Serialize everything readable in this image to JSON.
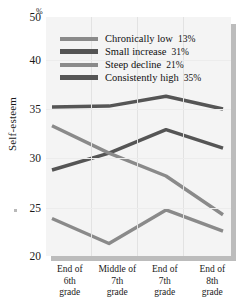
{
  "chart_data": {
    "type": "line",
    "title": "",
    "xlabel": "",
    "ylabel": "Self-esteem",
    "unit_symbol": "%",
    "categories": [
      "End of 6th grade",
      "Middle of 7th grade",
      "End of 7th grade",
      "End of 8th grade"
    ],
    "category_lines": [
      [
        "End of",
        "6th",
        "grade"
      ],
      [
        "Middle of",
        "7th",
        "grade"
      ],
      [
        "End of",
        "7th",
        "grade"
      ],
      [
        "End of",
        "8th",
        "grade"
      ]
    ],
    "yticks": [
      20,
      25,
      30,
      35,
      40,
      50
    ],
    "ytick_labels": [
      "20",
      "25",
      "30",
      "35",
      "40",
      "50"
    ],
    "ylim": [
      20,
      50
    ],
    "grid": true,
    "legend_position": "upper-center",
    "series": [
      {
        "name": "Chronically low",
        "share": "13%",
        "color": "#8a8a8a",
        "values": [
          23.9,
          21.3,
          24.8,
          22.6
        ]
      },
      {
        "name": "Small increase",
        "share": "31%",
        "color": "#555555",
        "values": [
          28.8,
          30.5,
          32.9,
          31.0
        ]
      },
      {
        "name": "Steep decline",
        "share": "21%",
        "color": "#8a8a8a",
        "values": [
          33.3,
          30.5,
          28.2,
          24.3
        ]
      },
      {
        "name": "Consistently high",
        "share": "35%",
        "color": "#555555",
        "values": [
          35.2,
          35.3,
          36.3,
          35.0
        ]
      }
    ]
  },
  "legend": {
    "items": [
      {
        "label": "Chronically low",
        "pct": "13%"
      },
      {
        "label": "Small increase",
        "pct": "31%"
      },
      {
        "label": "Steep decline",
        "pct": "21%"
      },
      {
        "label": "Consistently high",
        "pct": "35%"
      }
    ]
  },
  "axis": {
    "y_title": "Self-esteem",
    "percent_symbol": "%",
    "tick_50": "50",
    "tick_40": "40",
    "tick_35": "35",
    "tick_30": "30",
    "tick_25": "25",
    "tick_20": "20"
  },
  "xaxis": {
    "c0l0": "End of",
    "c0l1": "6th",
    "c0l2": "grade",
    "c1l0": "Middle of",
    "c1l1": "7th",
    "c1l2": "grade",
    "c2l0": "End of",
    "c2l1": "7th",
    "c2l2": "grade",
    "c3l0": "End of",
    "c3l1": "8th",
    "c3l2": "grade"
  }
}
